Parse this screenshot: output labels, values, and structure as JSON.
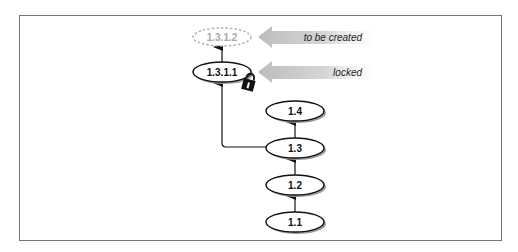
{
  "diagram": {
    "type": "revision-tree",
    "nodes": [
      {
        "id": "n1312",
        "label": "1.3.1.2",
        "style": "dashed",
        "cx": 222,
        "cy": 37
      },
      {
        "id": "n1311",
        "label": "1.3.1.1",
        "style": "solid",
        "cx": 222,
        "cy": 72,
        "locked": true
      },
      {
        "id": "n14",
        "label": "1.4",
        "style": "solid",
        "cx": 295,
        "cy": 111
      },
      {
        "id": "n13",
        "label": "1.3",
        "style": "solid",
        "cx": 295,
        "cy": 148
      },
      {
        "id": "n12",
        "label": "1.2",
        "style": "solid",
        "cx": 295,
        "cy": 185
      },
      {
        "id": "n11",
        "label": "1.1",
        "style": "solid",
        "cx": 295,
        "cy": 222
      }
    ],
    "edges": [
      {
        "from": "1.1",
        "to": "1.2"
      },
      {
        "from": "1.2",
        "to": "1.3"
      },
      {
        "from": "1.3",
        "to": "1.4"
      },
      {
        "from": "1.3",
        "to": "1.3.1.1"
      },
      {
        "from": "1.3.1.1",
        "to": "1.3.1.2"
      }
    ],
    "annotations": [
      {
        "target": "1.3.1.2",
        "label": "to be created"
      },
      {
        "target": "1.3.1.1",
        "label": "locked"
      }
    ],
    "icons": {
      "lock": "lock-icon"
    },
    "colors": {
      "frame": "#777777",
      "node_stroke": "#111111",
      "dashed_stroke": "#b0b0b0",
      "dashed_text": "#a8a8a8",
      "callout_arrow": "#c4c4c4",
      "shadow": "#9a9a9a"
    }
  }
}
